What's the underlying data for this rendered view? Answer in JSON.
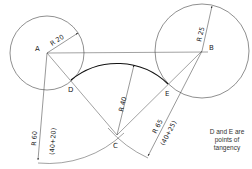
{
  "figure": {
    "points": {
      "A": {
        "label": "A"
      },
      "B": {
        "label": "B"
      },
      "C": {
        "label": "C"
      },
      "D": {
        "label": "D"
      },
      "E": {
        "label": "E"
      }
    },
    "dimensions": {
      "r_a": "R 20",
      "r_b": "R 25",
      "r_arc": "R 40",
      "r_60": "R 60",
      "r_60_calc": "(40+20)",
      "r_65": "R 65",
      "r_65_calc": "(40+25)"
    },
    "note": {
      "line1": "D and E are",
      "line2": "points of",
      "line3": "tangency"
    },
    "colors": {
      "stroke": "#333333",
      "background": "#ffffff"
    }
  }
}
